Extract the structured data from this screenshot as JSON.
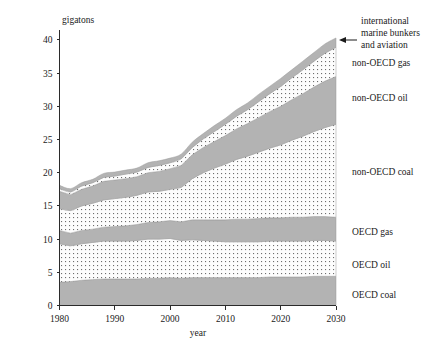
{
  "chart_data": {
    "type": "area",
    "title": "",
    "xlabel": "year",
    "ylabel": "gigatons",
    "xlim": [
      1980,
      2030
    ],
    "ylim": [
      0,
      41.5
    ],
    "grid": false,
    "legend_position": "right-inline",
    "stacked": true,
    "x": [
      1980,
      1982,
      1984,
      1986,
      1988,
      1990,
      1992,
      1994,
      1996,
      1998,
      2000,
      2002,
      2004,
      2006,
      2008,
      2010,
      2012,
      2014,
      2016,
      2018,
      2020,
      2022,
      2024,
      2026,
      2028,
      2030
    ],
    "xticks": [
      1980,
      1990,
      2000,
      2010,
      2020,
      2030
    ],
    "yticks": [
      0,
      5,
      10,
      15,
      20,
      25,
      30,
      35,
      40
    ],
    "series": [
      {
        "name": "OECD coal",
        "fill": "solid-gray",
        "values": [
          3.5,
          3.6,
          3.8,
          3.9,
          4.0,
          4.0,
          4.0,
          4.0,
          4.1,
          4.1,
          4.2,
          4.1,
          4.2,
          4.2,
          4.2,
          4.2,
          4.2,
          4.2,
          4.2,
          4.3,
          4.3,
          4.3,
          4.3,
          4.4,
          4.4,
          4.4
        ]
      },
      {
        "name": "OECD oil",
        "fill": "dotted",
        "values": [
          5.8,
          5.4,
          5.5,
          5.6,
          5.7,
          5.7,
          5.7,
          5.8,
          5.9,
          5.9,
          5.9,
          5.7,
          5.7,
          5.6,
          5.5,
          5.4,
          5.4,
          5.4,
          5.4,
          5.4,
          5.4,
          5.4,
          5.4,
          5.4,
          5.4,
          5.3
        ]
      },
      {
        "name": "OECD gas",
        "fill": "solid-gray",
        "values": [
          2.0,
          1.9,
          2.0,
          2.0,
          2.1,
          2.2,
          2.3,
          2.4,
          2.5,
          2.6,
          2.7,
          2.8,
          3.0,
          3.1,
          3.2,
          3.3,
          3.4,
          3.4,
          3.5,
          3.5,
          3.5,
          3.6,
          3.6,
          3.6,
          3.6,
          3.6
        ]
      },
      {
        "name": "non-OECD coal",
        "fill": "dotted",
        "values": [
          3.3,
          3.4,
          3.7,
          3.9,
          4.1,
          4.2,
          4.3,
          4.4,
          4.6,
          4.6,
          4.7,
          5.2,
          6.2,
          7.1,
          7.8,
          8.4,
          9.0,
          9.5,
          10.0,
          10.5,
          11.0,
          11.6,
          12.2,
          12.8,
          13.4,
          14.0
        ]
      },
      {
        "name": "non-OECD oil",
        "fill": "solid-gray",
        "values": [
          2.6,
          2.4,
          2.5,
          2.6,
          2.8,
          2.8,
          2.8,
          2.8,
          2.9,
          3.0,
          3.1,
          3.3,
          3.6,
          3.8,
          4.0,
          4.3,
          4.6,
          4.9,
          5.2,
          5.5,
          5.8,
          6.1,
          6.4,
          6.7,
          7.0,
          7.2
        ]
      },
      {
        "name": "non-OECD gas",
        "fill": "dotted",
        "values": [
          0.4,
          0.4,
          0.5,
          0.5,
          0.6,
          0.6,
          0.7,
          0.7,
          0.8,
          0.9,
          0.9,
          1.0,
          1.1,
          1.3,
          1.5,
          1.7,
          1.9,
          2.1,
          2.4,
          2.7,
          3.0,
          3.3,
          3.6,
          3.9,
          4.2,
          4.4
        ]
      },
      {
        "name": "international marine bunkers and aviation",
        "fill": "solid-gray",
        "values": [
          0.5,
          0.5,
          0.5,
          0.5,
          0.6,
          0.6,
          0.6,
          0.6,
          0.7,
          0.7,
          0.7,
          0.7,
          0.8,
          0.8,
          0.9,
          0.9,
          1.0,
          1.0,
          1.1,
          1.1,
          1.2,
          1.2,
          1.3,
          1.3,
          1.4,
          1.4
        ]
      }
    ],
    "totals": [
      18.1,
      17.6,
      18.5,
      19.0,
      19.9,
      20.1,
      20.4,
      20.7,
      21.5,
      21.8,
      22.2,
      22.8,
      24.6,
      25.9,
      27.1,
      28.2,
      29.5,
      30.5,
      31.8,
      33.0,
      34.2,
      35.5,
      36.8,
      38.1,
      39.4,
      40.3
    ]
  },
  "axes": {
    "y_title": "gigatons",
    "x_title": "year",
    "y_tick_labels": [
      "0",
      "5",
      "10",
      "15",
      "20",
      "25",
      "30",
      "35",
      "40"
    ],
    "x_tick_labels": [
      "1980",
      "1990",
      "2000",
      "2010",
      "2020",
      "2030"
    ]
  },
  "annotations": {
    "pointer_target": "international marine bunkers and aviation"
  },
  "labels": {
    "bunkers_line1": "international",
    "bunkers_line2": "marine bunkers",
    "bunkers_line3": "and aviation",
    "non_oecd_gas": "non-OECD gas",
    "non_oecd_oil": "non-OECD oil",
    "non_oecd_coal": "non-OECD coal",
    "oecd_gas": "OECD gas",
    "oecd_oil": "OECD oil",
    "oecd_coal": "OECD coal"
  },
  "colors": {
    "band_gray": "#b3b3b3",
    "dot_color": "#6e6e6e",
    "dot_bg": "#fdfdfd",
    "axis": "#2b2b2b",
    "text": "#1a1a1a",
    "band_edge": "#9a9a9a"
  }
}
